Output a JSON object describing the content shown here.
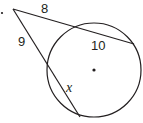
{
  "diagram": {
    "type": "two secants from an external point to a circle",
    "stroke_color": "#231f20",
    "background": "#ffffff",
    "labels": {
      "upper_external": "8",
      "lower_external": "9",
      "upper_internal": "10",
      "lower_internal": "x"
    },
    "points": {
      "external_point": [
        13,
        9
      ],
      "stray_dot": [
        2,
        13
      ],
      "center": [
        94,
        70
      ],
      "upper_entry": [
        73,
        28
      ],
      "upper_exit": [
        134,
        44
      ],
      "lower_entry": [
        49,
        66
      ],
      "lower_exit": [
        80,
        117
      ]
    },
    "circle": {
      "cx": 94,
      "cy": 70,
      "r": 47
    }
  }
}
